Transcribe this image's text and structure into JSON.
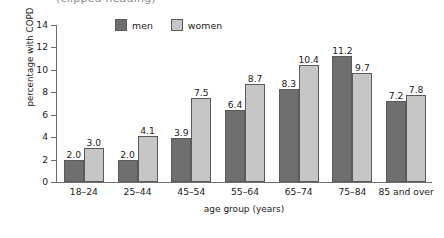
{
  "top_clipped_text": "(clipped heading)",
  "legend": {
    "position": "top-center",
    "items": [
      {
        "label": "men",
        "color": "#6f6f6f",
        "swatch": "legend-swatch"
      },
      {
        "label": "women",
        "color": "#c6c6c6",
        "swatch": "legend-swatch"
      }
    ]
  },
  "axes": {
    "ylabel": "percentage with COPD",
    "xlabel": "age group (years)",
    "yticks": [
      "0",
      "2",
      "4",
      "6",
      "8",
      "10",
      "12",
      "14"
    ]
  },
  "chart_data": {
    "type": "bar",
    "title": "",
    "subtitle": "",
    "xlabel": "age group (years)",
    "ylabel": "percentage with COPD",
    "ylim": [
      0,
      14
    ],
    "ytick_values": [
      0,
      2,
      4,
      6,
      8,
      10,
      12,
      14
    ],
    "grid": false,
    "legend_position": "top-center",
    "categories": [
      "18–24",
      "25–44",
      "45–54",
      "55–64",
      "65–74",
      "75–84",
      "85 and over"
    ],
    "series": [
      {
        "name": "men",
        "color": "#6f6f6f",
        "values": [
          2.0,
          2.0,
          3.9,
          6.4,
          8.3,
          11.2,
          7.2
        ],
        "data_labels": [
          "2.0",
          "2.0",
          "3.9",
          "6.4",
          "8.3",
          "11.2",
          "7.2"
        ]
      },
      {
        "name": "women",
        "color": "#c6c6c6",
        "values": [
          3.0,
          4.1,
          7.5,
          8.7,
          10.4,
          9.7,
          7.8
        ],
        "data_labels": [
          "3.0",
          "4.1",
          "7.5",
          "8.7",
          "10.4",
          "9.7",
          "7.8"
        ]
      }
    ]
  }
}
